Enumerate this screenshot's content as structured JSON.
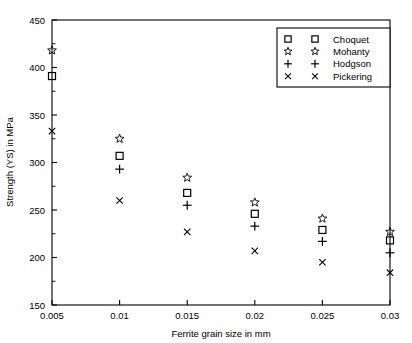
{
  "chart_data": {
    "type": "scatter",
    "title": "",
    "xlabel": "Ferrite grain size in mm",
    "ylabel": "Strength (YS) in MPa",
    "xlim": [
      0.005,
      0.03
    ],
    "ylim": [
      150,
      450
    ],
    "xticks": [
      0.005,
      0.01,
      0.015,
      0.02,
      0.025,
      0.03
    ],
    "xticklabels": [
      "0.005",
      "0.01",
      "0.015",
      "0.02",
      "0.025",
      "0.03"
    ],
    "yticks": [
      150,
      200,
      250,
      300,
      350,
      400,
      450
    ],
    "yticklabels": [
      "150",
      "200",
      "250",
      "300",
      "350",
      "400",
      "450"
    ],
    "y_minor_ticks": [
      175,
      225,
      275,
      325,
      375,
      425
    ],
    "grid": false,
    "legend_position": "top-right",
    "x": [
      0.005,
      0.01,
      0.015,
      0.02,
      0.025,
      0.03
    ],
    "series": [
      {
        "name": "Choquet",
        "marker": "square",
        "x": [
          0.005,
          0.01,
          0.015,
          0.02,
          0.025,
          0.03
        ],
        "values": [
          391,
          307,
          268,
          246,
          229,
          218
        ]
      },
      {
        "name": "Mohanty",
        "marker": "star",
        "x": [
          0.005,
          0.01,
          0.015,
          0.02,
          0.025,
          0.03
        ],
        "values": [
          418,
          325,
          284,
          258,
          241,
          227
        ]
      },
      {
        "name": "Hodgson",
        "marker": "plus",
        "x": [
          0.01,
          0.015,
          0.02,
          0.025,
          0.03
        ],
        "values": [
          293,
          255,
          233,
          217,
          205
        ]
      },
      {
        "name": "Pickering",
        "marker": "x",
        "x": [
          0.005,
          0.01,
          0.015,
          0.02,
          0.025,
          0.03
        ],
        "values": [
          333,
          260,
          227,
          207,
          195,
          184
        ]
      }
    ]
  },
  "legend": {
    "entries": [
      {
        "label": "Choquet",
        "marker": "square"
      },
      {
        "label": "Mohanty",
        "marker": "star"
      },
      {
        "label": "Hodgson",
        "marker": "plus"
      },
      {
        "label": "Pickering",
        "marker": "x"
      }
    ]
  },
  "colors": {
    "foreground": "#000000",
    "background": "#ffffff"
  }
}
